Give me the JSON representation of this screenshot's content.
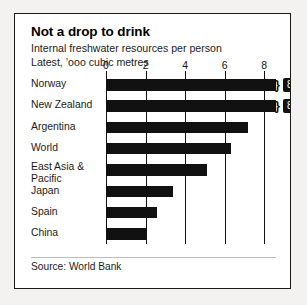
{
  "title": "Not a drop to drink",
  "subtitle_line1": "Internal freshwater resources per person",
  "subtitle_line2": "Latest, ’ooo cubic metres",
  "source": "Source: World Bank",
  "chart_data": {
    "type": "bar",
    "orientation": "horizontal",
    "title": "Not a drop to drink",
    "subtitle": "Internal freshwater resources per person",
    "units": "Latest, ’ooo cubic metres",
    "xlabel": "",
    "ylabel": "",
    "xlim": [
      0,
      8.6
    ],
    "axis_is_broken": true,
    "grid": true,
    "legend": "none",
    "bar_color": "#111111",
    "tick_values": [
      0,
      2,
      4,
      6,
      8
    ],
    "tick_labels": [
      "0",
      "2",
      "4",
      "6",
      "8"
    ],
    "categories": [
      "Norway",
      "New Zealand",
      "Argentina",
      "World",
      "East Asia & Pacific",
      "Japan",
      "Spain",
      "China"
    ],
    "values": [
      83.7,
      81.6,
      7.2,
      6.3,
      5.1,
      3.4,
      2.6,
      2.0
    ],
    "plotted_lengths": [
      8.6,
      8.6,
      7.2,
      6.3,
      5.1,
      3.4,
      2.6,
      2.0
    ],
    "value_labels": [
      {
        "category": "Norway",
        "text": "83.7",
        "truncated": true
      },
      {
        "category": "New Zealand",
        "text": "81.6",
        "truncated": true
      }
    ],
    "source": "Source: World Bank"
  },
  "categories": [
    {
      "label": "Norway",
      "label_line2": ""
    },
    {
      "label": "New Zealand",
      "label_line2": ""
    },
    {
      "label": "Argentina",
      "label_line2": ""
    },
    {
      "label": "World",
      "label_line2": ""
    },
    {
      "label": "East Asia &",
      "label_line2": "Pacific"
    },
    {
      "label": "Japan",
      "label_line2": ""
    },
    {
      "label": "Spain",
      "label_line2": ""
    },
    {
      "label": "China",
      "label_line2": ""
    }
  ],
  "ticks": [
    {
      "label": "0"
    },
    {
      "label": "2"
    },
    {
      "label": "4"
    },
    {
      "label": "6"
    },
    {
      "label": "8"
    }
  ],
  "value_pills": [
    {
      "text": "83.7"
    },
    {
      "text": "81.6"
    }
  ]
}
